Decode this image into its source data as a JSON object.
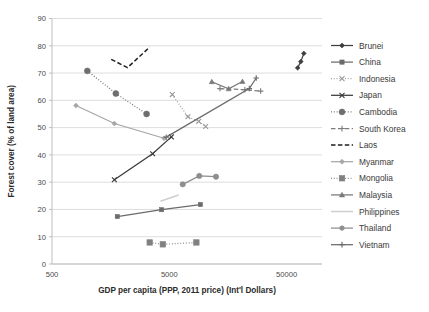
{
  "chart_data": {
    "type": "scatter",
    "title": "",
    "xlabel": "GDP per capita (PPP, 2011 price) (Int'l Dollars)",
    "ylabel": "Forest cover (% of land area)",
    "xscale": "log",
    "xlim": [
      500,
      100000
    ],
    "ylim": [
      0,
      90
    ],
    "yticks": [
      0,
      10,
      20,
      30,
      40,
      50,
      60,
      70,
      80,
      90
    ],
    "xticks": [
      500,
      5000,
      50000
    ],
    "xtick_labels": [
      "500",
      "5000",
      "50000"
    ],
    "grid": "horizontal",
    "legend_position": "right",
    "series": [
      {
        "name": "Brunei",
        "color": "#3f3f3f",
        "marker": "diamond",
        "dash": "solid",
        "points": [
          [
            62000,
            71.9
          ],
          [
            66000,
            74.2
          ],
          [
            70000,
            77.2
          ]
        ]
      },
      {
        "name": "China",
        "color": "#6b6b6b",
        "marker": "square",
        "dash": "solid",
        "points": [
          [
            1800,
            17.4
          ],
          [
            4300,
            19.9
          ],
          [
            9200,
            21.8
          ]
        ]
      },
      {
        "name": "Indonesia",
        "color": "#9a9a9a",
        "marker": "cross-x",
        "dash": "dotted",
        "points": [
          [
            5300,
            62.1
          ],
          [
            7200,
            54.0
          ],
          [
            8900,
            52.3
          ],
          [
            10200,
            50.4
          ]
        ]
      },
      {
        "name": "Japan",
        "color": "#3a3a3a",
        "marker": "cross-x",
        "dash": "solid",
        "points": [
          [
            1700,
            30.9
          ],
          [
            3600,
            40.4
          ],
          [
            5200,
            46.6
          ]
        ]
      },
      {
        "name": "Cambodia",
        "color": "#6e6e6e",
        "marker": "circle",
        "dash": "dotted",
        "points": [
          [
            1000,
            70.8
          ],
          [
            1750,
            62.5
          ],
          [
            3200,
            55.0
          ]
        ]
      },
      {
        "name": "South Korea",
        "color": "#7e7e7e",
        "marker": "plus",
        "dash": "dashed",
        "points": [
          [
            13500,
            64.3
          ],
          [
            22000,
            63.9
          ],
          [
            30000,
            63.4
          ]
        ]
      },
      {
        "name": "Laos",
        "color": "#1f1f1f",
        "marker": "none",
        "dash": "dashed",
        "points": [
          [
            1600,
            75.0
          ],
          [
            2200,
            72.0
          ],
          [
            3400,
            79.5
          ]
        ]
      },
      {
        "name": "Myanmar",
        "color": "#a6a6a6",
        "marker": "diamond",
        "dash": "solid",
        "points": [
          [
            800,
            58.1
          ],
          [
            1700,
            51.5
          ],
          [
            4500,
            46.1
          ]
        ]
      },
      {
        "name": "Mongolia",
        "color": "#808080",
        "marker": "square",
        "dash": "dotted",
        "points": [
          [
            3400,
            7.9
          ],
          [
            4400,
            7.2
          ],
          [
            8500,
            7.9
          ]
        ]
      },
      {
        "name": "Malaysia",
        "color": "#787878",
        "marker": "triangle",
        "dash": "solid",
        "points": [
          [
            11500,
            66.8
          ],
          [
            16000,
            64.2
          ],
          [
            21000,
            66.9
          ]
        ]
      },
      {
        "name": "Philippines",
        "color": "#cfcfcf",
        "marker": "none",
        "dash": "solid",
        "points": [
          [
            4200,
            23.0
          ],
          [
            6000,
            25.3
          ]
        ]
      },
      {
        "name": "Thailand",
        "color": "#8e8e8e",
        "marker": "circle",
        "dash": "solid",
        "points": [
          [
            6500,
            29.2
          ],
          [
            9000,
            32.3
          ],
          [
            12500,
            32.0
          ]
        ]
      },
      {
        "name": "Vietnam",
        "color": "#6a6a6a",
        "marker": "plus",
        "dash": "solid",
        "points": [
          [
            4700,
            46.5
          ],
          [
            24000,
            64.3
          ],
          [
            27500,
            68.2
          ]
        ]
      }
    ]
  },
  "axes": {
    "y_title": "Forest cover (% of land area)",
    "x_title": "GDP per capita (PPP, 2011 price) (Int'l Dollars)",
    "y_ticks": [
      "0",
      "10",
      "20",
      "30",
      "40",
      "50",
      "60",
      "70",
      "80",
      "90"
    ],
    "x_ticks": [
      "500",
      "5000",
      "50000"
    ]
  },
  "legend": {
    "items": [
      {
        "label": "Brunei"
      },
      {
        "label": "China"
      },
      {
        "label": "Indonesia"
      },
      {
        "label": "Japan"
      },
      {
        "label": "Cambodia"
      },
      {
        "label": "South Korea"
      },
      {
        "label": "Laos"
      },
      {
        "label": "Myanmar"
      },
      {
        "label": "Mongolia"
      },
      {
        "label": "Malaysia"
      },
      {
        "label": "Philippines"
      },
      {
        "label": "Thailand"
      },
      {
        "label": "Vietnam"
      }
    ]
  }
}
